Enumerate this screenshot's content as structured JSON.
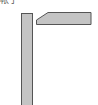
{
  "diagram": {
    "label": "帐子",
    "colors": {
      "fill": "#c4c4c4",
      "stroke": "#555555",
      "background": "#ffffff"
    },
    "shapes": [
      {
        "type": "vertical-post"
      },
      {
        "type": "angled-beam"
      }
    ]
  }
}
